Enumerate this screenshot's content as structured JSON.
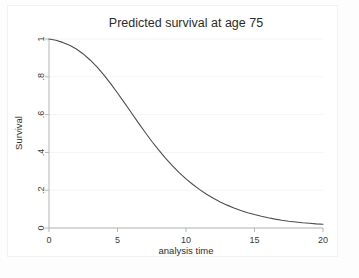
{
  "chart_data": {
    "type": "line",
    "title": "Predicted survival at age 75",
    "xlabel": "analysis time",
    "ylabel": "Survival",
    "xlim": [
      0,
      20
    ],
    "ylim": [
      0,
      1
    ],
    "grid": true,
    "grid_axis": "y",
    "legend": "none",
    "xticks": [
      0,
      5,
      10,
      15,
      20
    ],
    "xtick_labels": [
      "0",
      "5",
      "10",
      "15",
      "20"
    ],
    "yticks": [
      0,
      0.2,
      0.4,
      0.6,
      0.8,
      1
    ],
    "ytick_labels": [
      "0",
      ".2",
      ".4",
      ".6",
      ".8",
      "1"
    ],
    "series": [
      {
        "name": "Survival",
        "color": "#4d4d4d",
        "line_width": 1.1,
        "x": [
          0,
          0.5,
          1,
          1.5,
          2,
          2.5,
          3,
          3.5,
          4,
          4.5,
          5,
          5.5,
          6,
          6.5,
          7,
          7.5,
          8,
          8.5,
          9,
          9.5,
          10,
          10.5,
          11,
          11.5,
          12,
          12.5,
          13,
          13.5,
          14,
          14.5,
          15,
          15.5,
          16,
          16.5,
          17,
          17.5,
          18,
          18.5,
          19,
          19.5,
          20
        ],
        "y": [
          1.0,
          0.993,
          0.982,
          0.967,
          0.947,
          0.921,
          0.889,
          0.852,
          0.81,
          0.764,
          0.714,
          0.663,
          0.611,
          0.559,
          0.508,
          0.459,
          0.413,
          0.37,
          0.33,
          0.293,
          0.26,
          0.23,
          0.203,
          0.179,
          0.157,
          0.138,
          0.121,
          0.106,
          0.093,
          0.081,
          0.071,
          0.062,
          0.054,
          0.047,
          0.041,
          0.036,
          0.032,
          0.028,
          0.025,
          0.022,
          0.02
        ]
      }
    ]
  }
}
